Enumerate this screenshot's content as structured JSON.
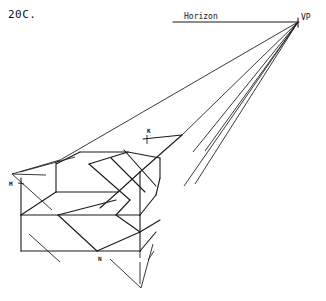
{
  "figure": {
    "label": "20C.",
    "horizon_label": "Horizon",
    "vp_label": "VP",
    "point_labels": {
      "K": "K",
      "M": "M",
      "N": "N"
    }
  }
}
